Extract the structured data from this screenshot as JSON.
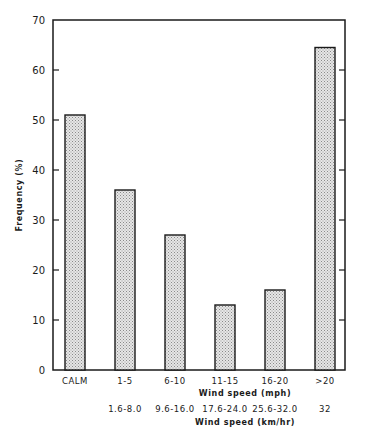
{
  "chart_data": {
    "type": "bar",
    "title": "",
    "categories": [
      "CALM",
      "1-5",
      "6-10",
      "11-15",
      "16-20",
      ">20"
    ],
    "secondary_categories": [
      "",
      "1.6-8.0",
      "9.6-16.0",
      "17.6-24.0",
      "25.6-32.0",
      "32"
    ],
    "values": [
      51,
      36,
      27,
      13,
      16,
      64.5
    ],
    "xlabel": "Wind speed (mph)",
    "xlabel_secondary": "Wind speed (km/hr)",
    "ylabel": "Frequency (%)",
    "ylim": [
      0,
      70
    ],
    "yticks": [
      0,
      10,
      20,
      30,
      40,
      50,
      60,
      70
    ],
    "grid": false,
    "legend": null,
    "bar_fill": "stippled grey",
    "colors": {
      "bar_fill": "#c8c8c8",
      "outline": "#1a1a1a"
    }
  }
}
